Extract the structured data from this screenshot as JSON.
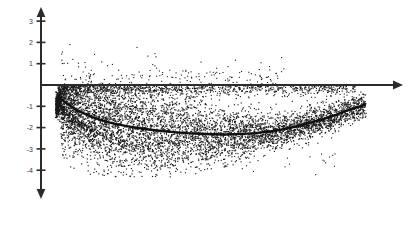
{
  "chart_data": {
    "type": "scatter",
    "title": "",
    "subtitle": "",
    "xlabel": "",
    "ylabel": "",
    "grid": false,
    "legend": null,
    "axes": {
      "x_axis": {
        "visible": true,
        "style": "arrow-right",
        "tick_labels": [],
        "range_px": [
          41,
          402
        ],
        "y_value": 0
      },
      "y_axis": {
        "visible": true,
        "style": "double-arrow",
        "tick_labels": [
          "3",
          "2",
          "1",
          "-1",
          "-2",
          "-3",
          "-4"
        ],
        "tick_values": [
          3,
          2,
          1,
          -1,
          -2,
          -3,
          -4
        ],
        "ylim": [
          -4.6,
          3.6
        ]
      }
    },
    "series": [
      {
        "name": "points",
        "type": "scatter",
        "marker": "dot",
        "color": "#1a1a1a",
        "n_points": 6200,
        "x_range": [
          0.05,
          1.0
        ],
        "y_range": [
          -4.0,
          2.1
        ],
        "description": "dense wedge-shaped cloud, densest just below zero at left, widening and sinking toward the middle, tapering up at the right"
      },
      {
        "name": "fit",
        "type": "line",
        "color": "#111111",
        "linewidth": 2.4,
        "points": [
          [
            0.055,
            -0.6
          ],
          [
            0.12,
            -1.25
          ],
          [
            0.2,
            -1.72
          ],
          [
            0.3,
            -2.02
          ],
          [
            0.4,
            -2.2
          ],
          [
            0.5,
            -2.3
          ],
          [
            0.58,
            -2.32
          ],
          [
            0.66,
            -2.26
          ],
          [
            0.74,
            -2.1
          ],
          [
            0.82,
            -1.82
          ],
          [
            0.9,
            -1.46
          ],
          [
            0.96,
            -1.12
          ],
          [
            1.0,
            -0.92
          ]
        ]
      }
    ]
  },
  "colors": {
    "axis": "#2b2b2b",
    "point": "#1a1a1a",
    "fit_line": "#111111",
    "background": "#ffffff",
    "tick_text": "#3a3a3a"
  }
}
